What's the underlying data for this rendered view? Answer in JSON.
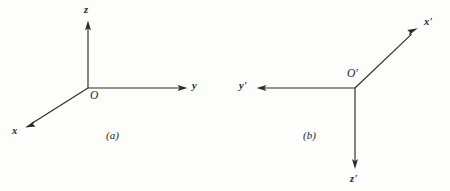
{
  "figure": {
    "background_color": "#fdfdfb",
    "ink_color": "#2b2b2b",
    "width": 450,
    "height": 191
  },
  "panels": [
    {
      "caption": "(a)",
      "origin_label": "O",
      "origin": {
        "x": 88,
        "y": 88
      },
      "axes": [
        {
          "label": "z",
          "name": "z-axis",
          "direction": "up",
          "from": {
            "x": 88,
            "y": 88
          },
          "to": {
            "x": 88,
            "y": 22
          },
          "label_pos": {
            "x": 84,
            "y": 5
          }
        },
        {
          "label": "y",
          "name": "y-axis",
          "direction": "right",
          "from": {
            "x": 88,
            "y": 88
          },
          "to": {
            "x": 186,
            "y": 88
          },
          "label_pos": {
            "x": 192,
            "y": 81
          }
        },
        {
          "label": "x",
          "name": "x-axis",
          "direction": "down-left",
          "from": {
            "x": 88,
            "y": 88
          },
          "to": {
            "x": 26,
            "y": 127
          },
          "label_pos": {
            "x": 12,
            "y": 126
          }
        }
      ]
    },
    {
      "caption": "(b)",
      "origin_label": "O'",
      "origin": {
        "x": 355,
        "y": 88
      },
      "axes": [
        {
          "label": "x'",
          "name": "x-prime-axis",
          "direction": "up-right",
          "from": {
            "x": 355,
            "y": 88
          },
          "to": {
            "x": 417,
            "y": 29
          },
          "label_pos": {
            "x": 424,
            "y": 17
          }
        },
        {
          "label": "y'",
          "name": "y-prime-axis",
          "direction": "left",
          "from": {
            "x": 355,
            "y": 88
          },
          "to": {
            "x": 258,
            "y": 88
          },
          "label_pos": {
            "x": 239,
            "y": 81
          }
        },
        {
          "label": "z'",
          "name": "z-prime-axis",
          "direction": "down",
          "from": {
            "x": 355,
            "y": 88
          },
          "to": {
            "x": 355,
            "y": 168
          },
          "label_pos": {
            "x": 350,
            "y": 174
          }
        }
      ]
    }
  ]
}
